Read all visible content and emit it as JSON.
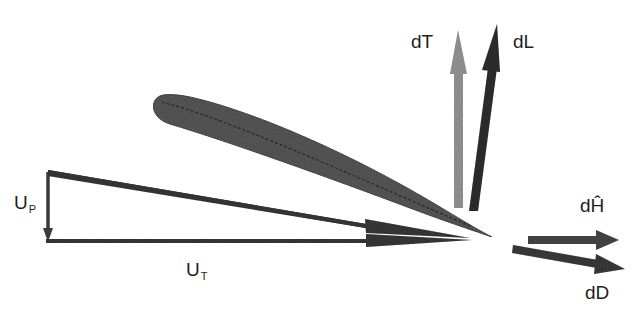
{
  "diagram": {
    "type": "blade-element velocity and force diagram",
    "colors": {
      "background": "#ffffff",
      "airfoil": "#5a5a5a",
      "velocity_arrows": "#3a3a3a",
      "dT_arrow": "#9a9a9a",
      "dL_arrow": "#333333",
      "dH_arrow": "#4a4a4a",
      "dD_arrow": "#3e3e3e",
      "text": "#1e1e1e"
    },
    "labels": {
      "up_main": "U",
      "up_sub": "P",
      "ut_main": "U",
      "ut_sub": "T",
      "dT": "dT",
      "dL": "dL",
      "dH": "dĤ",
      "dD": "dD"
    },
    "elements": [
      {
        "id": "airfoil",
        "description": "airfoil section, inclined, leading edge at upper-left, trailing edge at lower-right"
      },
      {
        "id": "resultant-velocity",
        "description": "arrow from top of U_P to trailing edge"
      },
      {
        "id": "ut-vector",
        "description": "horizontal tangential velocity U_T"
      },
      {
        "id": "up-vector",
        "description": "vertical perpendicular velocity U_P pointing down"
      },
      {
        "id": "dT",
        "description": "vertical thrust force, light gray"
      },
      {
        "id": "dL",
        "description": "lift force, tilted slightly right, dark"
      },
      {
        "id": "dH",
        "description": "horizontal in-plane force"
      },
      {
        "id": "dD",
        "description": "drag force, parallel to resultant velocity"
      }
    ]
  }
}
